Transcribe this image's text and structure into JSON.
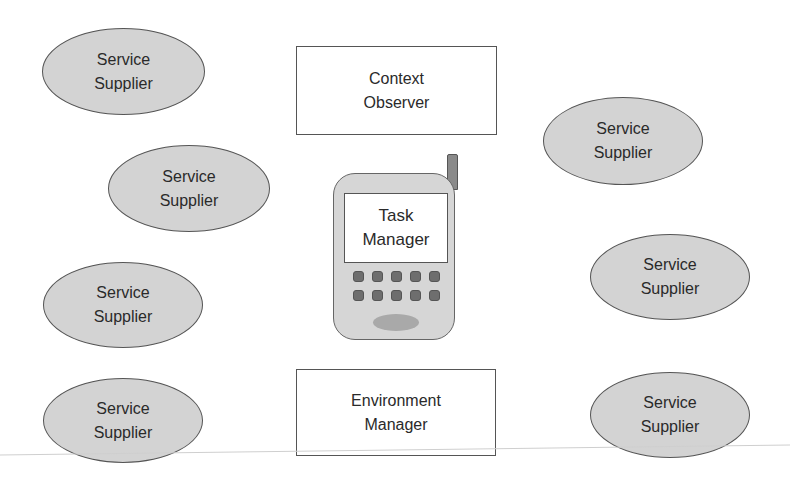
{
  "diagram": {
    "title": "",
    "colors": {
      "supplier_fill": "#d3d3d3",
      "outline": "#555555",
      "box_fill": "#ffffff",
      "phone_fill": "#d6d6d6",
      "key_fill": "#6e6e6e"
    },
    "suppliers": [
      {
        "line1": "Service",
        "line2": "Supplier"
      },
      {
        "line1": "Service",
        "line2": "Supplier"
      },
      {
        "line1": "Service",
        "line2": "Supplier"
      },
      {
        "line1": "Service",
        "line2": "Supplier"
      },
      {
        "line1": "Service",
        "line2": "Supplier"
      },
      {
        "line1": "Service",
        "line2": "Supplier"
      },
      {
        "line1": "Service",
        "line2": "Supplier"
      }
    ],
    "context_observer": {
      "line1": "Context",
      "line2": "Observer"
    },
    "environment_manager": {
      "line1": "Environment",
      "line2": "Manager"
    },
    "task_manager": {
      "line1": "Task",
      "line2": "Manager",
      "icon": "mobile-phone-icon",
      "keypad_rows": 2,
      "keypad_cols": 5
    }
  }
}
